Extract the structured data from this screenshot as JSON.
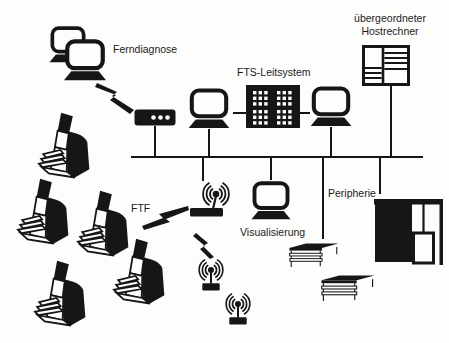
{
  "meta": {
    "kind": "system-architecture-diagram",
    "language": "de",
    "topic": "FTS (fahrerloses Transportsystem) Leitsystem-Struktur"
  },
  "colors": {
    "ink": "#161616",
    "background": "#fdfdfc"
  },
  "nodes": {
    "ferndiagnose": {
      "label": "Ferndiagnose",
      "icon": "dual-workstation-icon"
    },
    "modem": {
      "icon": "modem-icon"
    },
    "fts_leitsystem": {
      "label": "FTS-Leitsystem",
      "icon": "control-computer-icon"
    },
    "hostrechner": {
      "label": "übergeordneter Hostrechner",
      "icon": "host-cabinet-icon"
    },
    "workstation_left": {
      "icon": "workstation-icon"
    },
    "workstation_right": {
      "icon": "workstation-icon"
    },
    "visualisierung": {
      "label": "Visualisierung",
      "icon": "workstation-icon"
    },
    "peripherie": {
      "label": "Peripherie",
      "icons": [
        "shelf-rack-icon",
        "storage-machine-icon"
      ]
    },
    "ftf": {
      "label": "FTF",
      "vehicle_count": 5,
      "icon": "agv-vehicle-icon"
    },
    "antennas": {
      "count": 3,
      "icon": "wireless-antenna-icon"
    }
  },
  "links": [
    {
      "from": "ferndiagnose",
      "to": "modem",
      "type": "wireless-lightning"
    },
    {
      "from": "modem",
      "to": "bus",
      "type": "line"
    },
    {
      "from": "workstation_left",
      "to": "fts_leitsystem",
      "type": "line"
    },
    {
      "from": "fts_leitsystem",
      "to": "workstation_right",
      "type": "line"
    },
    {
      "from": "workstation_left",
      "to": "bus",
      "type": "line"
    },
    {
      "from": "workstation_right",
      "to": "bus",
      "type": "line"
    },
    {
      "from": "hostrechner",
      "to": "bus",
      "type": "line"
    },
    {
      "from": "bus",
      "to": "antenna_1",
      "type": "line"
    },
    {
      "from": "antenna_1",
      "to": "antenna_2",
      "type": "wireless-lightning"
    },
    {
      "from": "ftf",
      "to": "antenna_1",
      "type": "wireless-lightning"
    },
    {
      "from": "bus",
      "to": "visualisierung",
      "type": "line"
    },
    {
      "from": "bus",
      "to": "peripherie_shelves",
      "type": "line"
    },
    {
      "from": "bus",
      "to": "peripherie_machine",
      "type": "line"
    }
  ]
}
